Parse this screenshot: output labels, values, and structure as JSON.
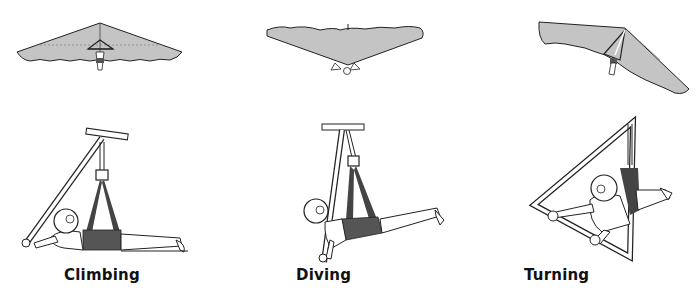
{
  "figure": {
    "panels": [
      {
        "id": "climbing",
        "label": "Climbing",
        "glider_view": "top-down, nose forward",
        "pilot_position": "prone, control bar pulled in"
      },
      {
        "id": "diving",
        "label": "Diving",
        "glider_view": "nose down, from front",
        "pilot_position": "prone, control bar pushed out"
      },
      {
        "id": "turning",
        "label": "Turning",
        "glider_view": "banked wing",
        "pilot_position": "weight shifted sideways"
      }
    ],
    "colors": {
      "sail": "#c4c4c4",
      "outline": "#1a1a1a",
      "harness": "#555555",
      "background": "#ffffff"
    }
  }
}
